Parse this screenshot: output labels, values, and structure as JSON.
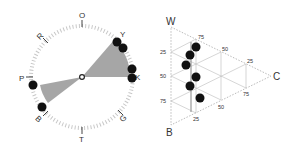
{
  "figure": {
    "panels": 2
  },
  "circle_plot": {
    "labels": [
      {
        "text": "O",
        "angle": 0
      },
      {
        "text": "Y",
        "angle": 40
      },
      {
        "text": "K",
        "angle": 90
      },
      {
        "text": "G",
        "angle": 135
      },
      {
        "text": "T",
        "angle": 180
      },
      {
        "text": "B",
        "angle": 225
      },
      {
        "text": "P",
        "angle": 270
      },
      {
        "text": "R",
        "angle": 315
      }
    ],
    "sector_color": "#a6a6a6",
    "dot_color": "#111111"
  },
  "ternary_plot": {
    "vertices": {
      "top": "W",
      "right": "C",
      "bottom": "B"
    },
    "left_ticks": [
      "25",
      "50",
      "75"
    ],
    "top_edge_ticks": [
      "75",
      "50",
      "25"
    ],
    "bottom_edge_ticks": [
      "25",
      "50",
      "75"
    ],
    "grid_color": "#bbbbbb",
    "dot_color": "#111111"
  }
}
